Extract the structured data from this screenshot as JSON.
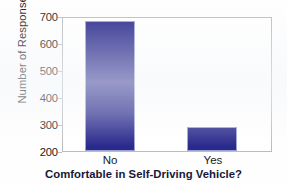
{
  "chart_data": {
    "type": "bar",
    "title": "",
    "xlabel": "Comfortable in Self-Driving Vehicle?",
    "ylabel": "Number of Responses",
    "categories": [
      "No",
      "Yes"
    ],
    "values": [
      690,
      290
    ],
    "ylim": [
      200,
      700
    ],
    "yticks": [
      200,
      300,
      400,
      500,
      600,
      700
    ],
    "ytick_labels": [
      "200",
      "300",
      "400",
      "500",
      "600",
      "700"
    ],
    "grid": false,
    "legend": false,
    "bar_color": "#2a2a8c",
    "frame_color": "#b9bcc2",
    "background_color": "#ffffff"
  }
}
